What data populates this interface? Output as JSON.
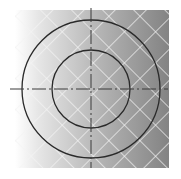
{
  "diagram": {
    "type": "concentric-circles-with-crosshair",
    "background": {
      "x": 15,
      "y": 10,
      "width": 154,
      "height": 158,
      "gradient_from": "#ffffff",
      "gradient_to": "#858585",
      "hatch_color": "#f2f2f2",
      "hatch_spacing": 22
    },
    "center": {
      "x": 91,
      "y": 89
    },
    "circles": [
      {
        "name": "outer-circle",
        "r": 69,
        "stroke": "#2a2a2a"
      },
      {
        "name": "inner-circle",
        "r": 39,
        "stroke": "#2a2a2a"
      }
    ],
    "crosshair": {
      "horizontal": {
        "x1": 10,
        "x2": 168,
        "y": 89
      },
      "vertical": {
        "x": 91,
        "y1": 8,
        "y2": 168
      },
      "stroke": "#3a3a3a",
      "dash": "14 3 2 3"
    }
  }
}
